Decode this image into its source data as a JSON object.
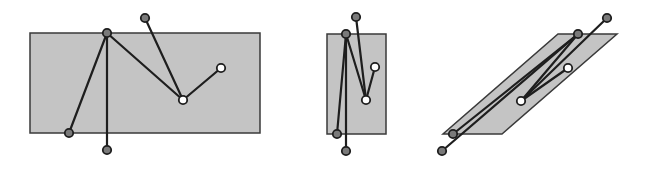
{
  "colors": {
    "shape_fill": "#c4c4c4",
    "shape_stroke": "#3a3a3a",
    "edge": "#1e1e1e",
    "node_dark": "#7a7a7a",
    "node_light": "#ffffff",
    "node_stroke": "#1e1e1e"
  },
  "panels": [
    {
      "name": "rectangle-wide",
      "shape": [
        [
          30,
          33
        ],
        [
          260,
          33
        ],
        [
          260,
          133
        ],
        [
          30,
          133
        ]
      ],
      "nodes": [
        {
          "id": "top-vertex",
          "x": 107,
          "y": 33,
          "kind": "dark"
        },
        {
          "id": "top-outside",
          "x": 145,
          "y": 18,
          "kind": "dark"
        },
        {
          "id": "bottom-left",
          "x": 69,
          "y": 133,
          "kind": "dark"
        },
        {
          "id": "bottom-stem",
          "x": 107,
          "y": 150,
          "kind": "dark"
        },
        {
          "id": "inner-mid",
          "x": 183,
          "y": 100,
          "kind": "light"
        },
        {
          "id": "inner-right",
          "x": 221,
          "y": 68,
          "kind": "light"
        }
      ],
      "edges": [
        [
          "top-vertex",
          "bottom-left"
        ],
        [
          "top-vertex",
          "bottom-stem"
        ],
        [
          "top-vertex",
          "inner-mid"
        ],
        [
          "top-outside",
          "inner-mid"
        ],
        [
          "inner-mid",
          "inner-right"
        ]
      ]
    },
    {
      "name": "rectangle-narrow",
      "shape": [
        [
          327,
          34
        ],
        [
          386,
          34
        ],
        [
          386,
          134
        ],
        [
          327,
          134
        ]
      ],
      "nodes": [
        {
          "id": "top-vertex",
          "x": 346,
          "y": 34,
          "kind": "dark"
        },
        {
          "id": "top-outside",
          "x": 356,
          "y": 17,
          "kind": "dark"
        },
        {
          "id": "bottom-left",
          "x": 337,
          "y": 134,
          "kind": "dark"
        },
        {
          "id": "bottom-stem",
          "x": 346,
          "y": 151,
          "kind": "dark"
        },
        {
          "id": "inner-mid",
          "x": 366,
          "y": 100,
          "kind": "light"
        },
        {
          "id": "inner-right",
          "x": 375,
          "y": 67,
          "kind": "light"
        }
      ],
      "edges": [
        [
          "top-vertex",
          "bottom-left"
        ],
        [
          "top-vertex",
          "bottom-stem"
        ],
        [
          "top-vertex",
          "inner-mid"
        ],
        [
          "top-outside",
          "inner-mid"
        ],
        [
          "inner-mid",
          "inner-right"
        ]
      ]
    },
    {
      "name": "parallelogram-sheared",
      "shape": [
        [
          558,
          34
        ],
        [
          617,
          34
        ],
        [
          502,
          134
        ],
        [
          443,
          134
        ]
      ],
      "nodes": [
        {
          "id": "top-vertex",
          "x": 578,
          "y": 34,
          "kind": "dark"
        },
        {
          "id": "top-outside",
          "x": 607,
          "y": 18,
          "kind": "dark"
        },
        {
          "id": "bottom-left",
          "x": 453,
          "y": 134,
          "kind": "dark"
        },
        {
          "id": "bottom-stem",
          "x": 442,
          "y": 151,
          "kind": "dark"
        },
        {
          "id": "inner-mid",
          "x": 521,
          "y": 101,
          "kind": "light"
        },
        {
          "id": "inner-right",
          "x": 568,
          "y": 68,
          "kind": "light"
        }
      ],
      "edges": [
        [
          "top-vertex",
          "bottom-left"
        ],
        [
          "top-vertex",
          "bottom-stem"
        ],
        [
          "top-vertex",
          "inner-mid"
        ],
        [
          "top-outside",
          "inner-mid"
        ],
        [
          "inner-mid",
          "inner-right"
        ]
      ]
    }
  ]
}
